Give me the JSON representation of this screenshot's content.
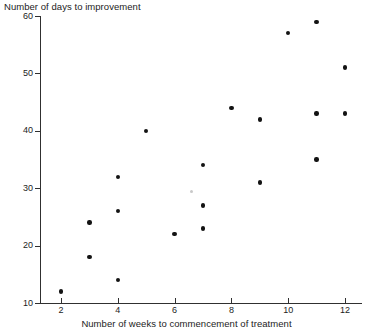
{
  "chart_data": {
    "type": "scatter",
    "title": "",
    "ylabel": "Number of days to improvement",
    "xlabel": "Number of weeks to commencement of treatment",
    "xlim": [
      1,
      13
    ],
    "ylim": [
      10,
      60
    ],
    "xticks": [
      2,
      4,
      6,
      8,
      10,
      12
    ],
    "yticks": [
      10,
      20,
      30,
      40,
      50,
      60
    ],
    "xtick_labels": [
      "2",
      "4",
      "6",
      "8",
      "10",
      "12"
    ],
    "ytick_labels": [
      "10",
      "20",
      "30",
      "40",
      "50",
      "60"
    ],
    "grid": false,
    "legend": false,
    "marker": "filled-circle",
    "marker_color": "#131313",
    "axis_color": "#303030",
    "x": [
      2,
      3,
      3,
      4,
      4,
      4,
      5,
      6,
      7,
      7,
      7,
      8,
      9,
      9,
      10,
      11,
      11,
      11,
      12,
      12
    ],
    "y": [
      12,
      24,
      18,
      32,
      26,
      14,
      40,
      22,
      34,
      27,
      23,
      44,
      42,
      31,
      57,
      59,
      43,
      35,
      51,
      43
    ],
    "points": [
      {
        "x": 2,
        "y": 12
      },
      {
        "x": 3,
        "y": 24
      },
      {
        "x": 3,
        "y": 18
      },
      {
        "x": 4,
        "y": 32
      },
      {
        "x": 4,
        "y": 26
      },
      {
        "x": 4,
        "y": 14
      },
      {
        "x": 5,
        "y": 40
      },
      {
        "x": 6,
        "y": 22
      },
      {
        "x": 7,
        "y": 34
      },
      {
        "x": 7,
        "y": 27
      },
      {
        "x": 7,
        "y": 23
      },
      {
        "x": 8,
        "y": 44
      },
      {
        "x": 9,
        "y": 42
      },
      {
        "x": 9,
        "y": 31
      },
      {
        "x": 10,
        "y": 57
      },
      {
        "x": 11,
        "y": 59
      },
      {
        "x": 11,
        "y": 43
      },
      {
        "x": 11,
        "y": 35
      },
      {
        "x": 12,
        "y": 51
      },
      {
        "x": 12,
        "y": 43
      }
    ],
    "n_points": 20
  }
}
